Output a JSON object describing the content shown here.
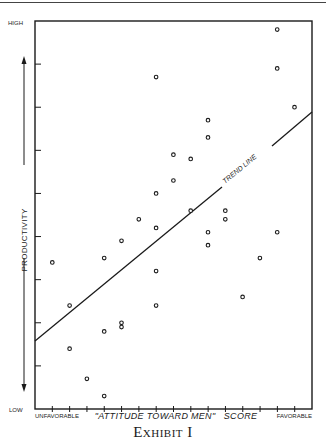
{
  "chart_data": {
    "type": "scatter",
    "title": "",
    "caption": "Exhibit I",
    "xlabel": "\"ATTITUDE TOWARD MEN\"   SCORE",
    "ylabel": "PRODUCTIVITY",
    "x_axis": {
      "low_label": "UNFAVORABLE",
      "high_label": "FAVORABLE",
      "range": [
        0,
        16
      ],
      "ticks": 16
    },
    "y_axis": {
      "low_label": "LOW",
      "high_label": "HIGH",
      "range": [
        0,
        9
      ],
      "ticks": 9
    },
    "grid": false,
    "legend": null,
    "annotations": [
      {
        "text": "TREND LINE",
        "target": "trend_line"
      }
    ],
    "trend_line": {
      "x": [
        0,
        16
      ],
      "y": [
        1.6,
        7.0
      ]
    },
    "points": [
      {
        "x": 1.0,
        "y": 3.4
      },
      {
        "x": 2.0,
        "y": 2.4
      },
      {
        "x": 2.0,
        "y": 1.4
      },
      {
        "x": 3.0,
        "y": 0.7
      },
      {
        "x": 4.0,
        "y": 0.3
      },
      {
        "x": 4.0,
        "y": 3.5
      },
      {
        "x": 4.0,
        "y": 1.8
      },
      {
        "x": 5.0,
        "y": 2.0
      },
      {
        "x": 5.0,
        "y": 1.9
      },
      {
        "x": 5.0,
        "y": 3.9
      },
      {
        "x": 7.0,
        "y": 7.7
      },
      {
        "x": 7.0,
        "y": 5.0
      },
      {
        "x": 7.0,
        "y": 4.2
      },
      {
        "x": 7.0,
        "y": 3.2
      },
      {
        "x": 7.0,
        "y": 2.4
      },
      {
        "x": 6.0,
        "y": 4.4
      },
      {
        "x": 8.0,
        "y": 5.9
      },
      {
        "x": 8.0,
        "y": 5.3
      },
      {
        "x": 9.0,
        "y": 5.8
      },
      {
        "x": 9.0,
        "y": 4.6
      },
      {
        "x": 10.0,
        "y": 6.7
      },
      {
        "x": 10.0,
        "y": 6.3
      },
      {
        "x": 10.0,
        "y": 4.1
      },
      {
        "x": 10.0,
        "y": 3.8
      },
      {
        "x": 11.0,
        "y": 4.6
      },
      {
        "x": 11.0,
        "y": 4.4
      },
      {
        "x": 12.0,
        "y": 2.6
      },
      {
        "x": 13.0,
        "y": 3.5
      },
      {
        "x": 14.0,
        "y": 8.8
      },
      {
        "x": 14.0,
        "y": 7.9
      },
      {
        "x": 14.0,
        "y": 4.1
      },
      {
        "x": 15.0,
        "y": 7.0
      }
    ]
  },
  "labels": {
    "y_high": "HIGH",
    "y_low": "LOW",
    "y_axis": "PRODUCTIVITY",
    "x_low": "UNFAVORABLE",
    "x_high": "FAVORABLE",
    "x_axis": "\"ATTITUDE TOWARD MEN\"   SCORE",
    "trend": "TREND LINE",
    "caption": "Exhibit I"
  }
}
